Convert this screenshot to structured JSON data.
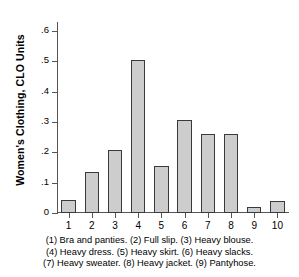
{
  "chart_data": {
    "type": "bar",
    "title": "",
    "subtitle": "",
    "xlabel": "",
    "ylabel": "Women's Clothing, CLO Units",
    "categories": [
      "1",
      "2",
      "3",
      "4",
      "5",
      "6",
      "7",
      "8",
      "9",
      "10"
    ],
    "values": [
      0.042,
      0.134,
      0.208,
      0.505,
      0.156,
      0.308,
      0.261,
      0.261,
      0.02,
      0.038
    ],
    "ylim": [
      0,
      0.63
    ],
    "yticks": [
      0,
      0.1,
      0.2,
      0.3,
      0.4,
      0.5,
      0.6
    ],
    "ytick_labels": [
      "0",
      ".1",
      ".2",
      ".3",
      ".4",
      ".5",
      ".6"
    ],
    "grid": false,
    "legend": "none",
    "bar_fill_color": "#cdcdcd",
    "bar_edge_color": "#3a3a3a",
    "axis_color": "#555555",
    "series": [
      {
        "name": "Women's Clothing, CLO Units",
        "values": [
          0.042,
          0.134,
          0.208,
          0.505,
          0.156,
          0.308,
          0.261,
          0.261,
          0.02,
          0.038
        ]
      }
    ],
    "category_descriptions": [
      "Bra and panties",
      "Full slip",
      "Heavy blouse",
      "Heavy dress",
      "Heavy skirt",
      "Heavy slacks",
      "Heavy sweater",
      "Heavy jacket",
      "Pantyhose"
    ]
  },
  "caption": {
    "line1": "(1) Bra and panties. (2) Full slip. (3) Heavy blouse.",
    "line2": "(4) Heavy dress. (5) Heavy skirt. (6) Heavy slacks.",
    "line3": "(7) Heavy sweater. (8) Heavy jacket. (9) Pantyhose."
  }
}
